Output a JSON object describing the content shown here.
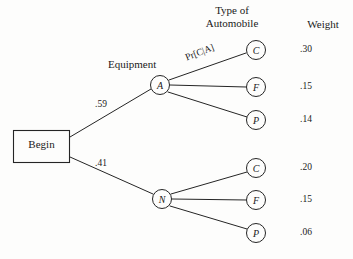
{
  "figure": {
    "type": "probability-tree-diagram",
    "root": {
      "label": "Begin"
    },
    "column_headers": {
      "type_of_automobile": "Type of\nAutomobile",
      "type_of_automobile_line1": "Type of",
      "type_of_automobile_line2": "Automobile",
      "equipment": "Equipment",
      "weight": "Weight"
    },
    "conditional_probability_label": "Pr[C|A]",
    "branches": [
      {
        "node_label": "A",
        "probability": ".59",
        "leaves": [
          {
            "label": "C",
            "weight": ".30"
          },
          {
            "label": "F",
            "weight": ".15"
          },
          {
            "label": "P",
            "weight": ".14"
          }
        ]
      },
      {
        "node_label": "N",
        "probability": ".41",
        "leaves": [
          {
            "label": "C",
            "weight": ".20"
          },
          {
            "label": "F",
            "weight": ".15"
          },
          {
            "label": "P",
            "weight": ".06"
          }
        ]
      }
    ],
    "weights_column": [
      ".30",
      ".15",
      ".14",
      ".20",
      ".15",
      ".06"
    ],
    "colors": {
      "background": "#fdfdfc",
      "ink": "#1a1a1a",
      "stroke": "#252525"
    }
  }
}
